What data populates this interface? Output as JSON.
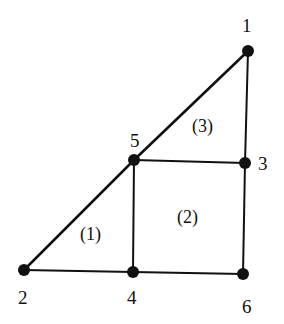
{
  "diagram": {
    "type": "finite-element-mesh",
    "nodes": [
      {
        "id": "1",
        "x": 248,
        "y": 51,
        "label": "1"
      },
      {
        "id": "2",
        "x": 24,
        "y": 270,
        "label": "2"
      },
      {
        "id": "3",
        "x": 245,
        "y": 163,
        "label": "3"
      },
      {
        "id": "4",
        "x": 133,
        "y": 272,
        "label": "4"
      },
      {
        "id": "5",
        "x": 134,
        "y": 160,
        "label": "5"
      },
      {
        "id": "6",
        "x": 243,
        "y": 274,
        "label": "6"
      }
    ],
    "edges": [
      [
        "1",
        "5"
      ],
      [
        "5",
        "2"
      ],
      [
        "1",
        "3"
      ],
      [
        "5",
        "3"
      ],
      [
        "5",
        "4"
      ],
      [
        "2",
        "4"
      ],
      [
        "4",
        "6"
      ],
      [
        "3",
        "6"
      ]
    ],
    "elements": [
      {
        "label": "(1)",
        "nodes": [
          "2",
          "4",
          "5"
        ]
      },
      {
        "label": "(2)",
        "nodes": [
          "4",
          "6",
          "3",
          "5"
        ]
      },
      {
        "label": "(3)",
        "nodes": [
          "5",
          "3",
          "1"
        ]
      }
    ]
  }
}
